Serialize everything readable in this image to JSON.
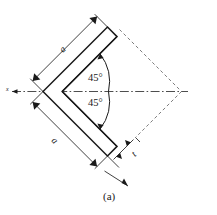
{
  "figure": {
    "caption": "(a)",
    "type": "equal-leg-angle-section-diagram",
    "labels": {
      "leg_upper": "a",
      "leg_lower": "a",
      "thickness": "t",
      "angle_upper": "45°",
      "angle_lower": "45°",
      "axis": "x"
    },
    "colors": {
      "outline": "#1a1a1a",
      "dimension": "#2b2b2b",
      "dashed": "#6e6e6e",
      "centerline": "#3a3a3a",
      "background": "#ffffff"
    },
    "geometry": {
      "apex_angle_total_deg": 90,
      "half_angle_deg": 45,
      "legs_equal": true,
      "orientation": "apex-left",
      "construction_lines": "dashed diamond closing to right vertex",
      "centerline_style": "dash-dot horizontal axis through apex"
    }
  }
}
